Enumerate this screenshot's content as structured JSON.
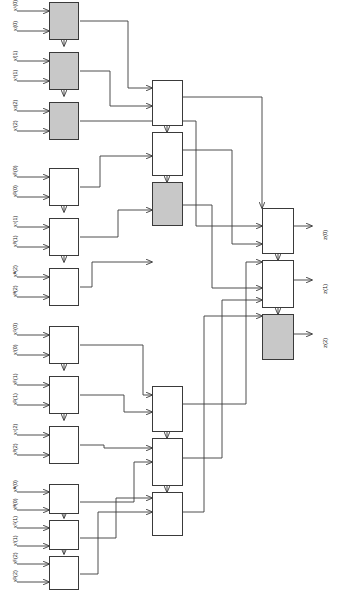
{
  "diagram": {
    "orientation": "rotated-90",
    "colors": {
      "line": "#3a3a3a",
      "box_fill": "#ffffff",
      "box_fill_highlight": "#c8c8c8",
      "background": "#ffffff",
      "text": "#1a1a1a"
    },
    "input_labels": [
      "x¹(0)",
      "xʲ(0)",
      "xᴵ(1)",
      "xʰ(1)",
      "xᵍ(2)",
      "xᶠ(2)",
      "xᴱ(0)",
      "xᴰ(0)",
      "xᶜ(1)",
      "xᴮ(1)",
      "xᴬ(2)",
      "xᴴ(2)",
      "xᴳ(0)",
      "xᶠ(0)",
      "xᴱ(1)",
      "xᴰ(1)",
      "xᶜ(2)",
      "xᴮ(2)",
      "xᴬ(0)",
      "xᴴ(0)",
      "xᴳ(1)",
      "xᶠ(1)",
      "xᴱ(2)",
      "xᴰ(2)"
    ],
    "output_labels": [
      "z(0)",
      "z(1)",
      "z(2)"
    ],
    "stage_names": [
      "input-adder-stage",
      "intermediate-stage",
      "output-stage"
    ],
    "counts": {
      "input_blocks": 12,
      "input_arrows": 24,
      "intermediate_blocks": 6,
      "output_blocks": 3,
      "highlighted_blocks": 5
    }
  }
}
